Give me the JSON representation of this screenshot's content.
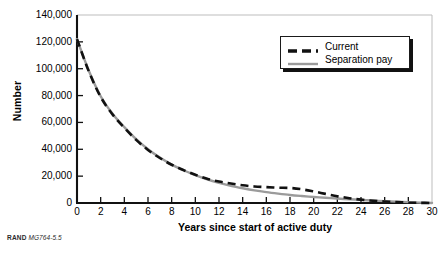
{
  "chart_data": {
    "type": "line",
    "title": "",
    "xlabel": "Years since start of active duty",
    "ylabel": "Number",
    "xlim": [
      0,
      30
    ],
    "ylim": [
      0,
      140000
    ],
    "grid": false,
    "legend_position": "top-right",
    "xticks": [
      "0",
      "2",
      "4",
      "6",
      "8",
      "10",
      "12",
      "14",
      "16",
      "18",
      "20",
      "22",
      "24",
      "26",
      "28",
      "30"
    ],
    "xtick_values": [
      0,
      2,
      4,
      6,
      8,
      10,
      12,
      14,
      16,
      18,
      20,
      22,
      24,
      26,
      28,
      30
    ],
    "yticks": [
      "0",
      "20,000",
      "40,000",
      "60,000",
      "80,000",
      "100,000",
      "120,000",
      "140,000"
    ],
    "ytick_values": [
      0,
      20000,
      40000,
      60000,
      80000,
      100000,
      120000,
      140000
    ],
    "x": [
      0,
      1,
      2,
      3,
      4,
      5,
      6,
      7,
      8,
      9,
      10,
      11,
      12,
      13,
      14,
      15,
      16,
      17,
      18,
      19,
      20,
      21,
      22,
      23,
      24,
      25,
      26,
      27,
      28,
      29,
      30
    ],
    "series": [
      {
        "name": "Current",
        "color": "#111111",
        "style": "dashed",
        "values": [
          122000,
          98000,
          79000,
          66000,
          56000,
          47000,
          39500,
          33500,
          28500,
          24500,
          21000,
          18000,
          16000,
          14500,
          13200,
          12300,
          11800,
          11400,
          11200,
          10200,
          8600,
          6800,
          5000,
          3600,
          2500,
          1700,
          1100,
          650,
          320,
          120,
          0
        ]
      },
      {
        "name": "Separation pay",
        "color": "#9b9b9b",
        "style": "solid",
        "values": [
          122000,
          98500,
          79500,
          66500,
          56500,
          47500,
          40000,
          33800,
          28600,
          24400,
          20800,
          17600,
          15000,
          12800,
          11000,
          9400,
          8100,
          7000,
          6000,
          5200,
          4500,
          3900,
          3300,
          2800,
          2300,
          1850,
          1400,
          1000,
          620,
          280,
          0
        ]
      }
    ]
  },
  "legend": {
    "items": [
      {
        "label": "Current"
      },
      {
        "label": "Separation pay"
      }
    ]
  },
  "credit": {
    "organization": "RAND",
    "figure_id": "MG764-5.5"
  }
}
